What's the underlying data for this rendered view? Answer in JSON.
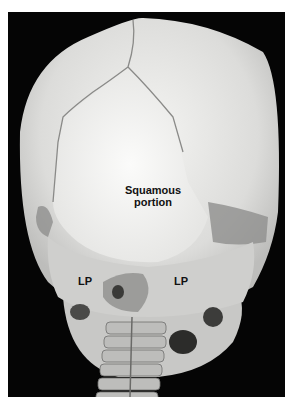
{
  "figure": {
    "type": "photograph",
    "background_color": "#050505",
    "labels": {
      "squamous_line1": "Squamous",
      "squamous_line2": "portion",
      "lp_left": "LP",
      "lp_right": "LP"
    }
  }
}
